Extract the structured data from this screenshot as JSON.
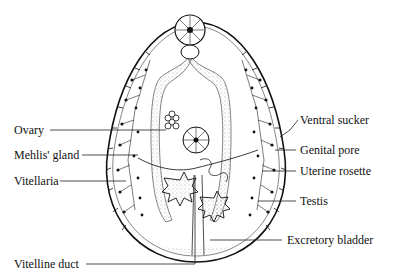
{
  "diagram": {
    "labels_left": [
      {
        "id": "ovary",
        "text": "Ovary"
      },
      {
        "id": "mehlis-gland",
        "text": "Mehlis' gland"
      },
      {
        "id": "vitellaria",
        "text": "Vitellaria"
      },
      {
        "id": "vitelline-duct",
        "text": "Vitelline duct"
      }
    ],
    "labels_right": [
      {
        "id": "ventral-sucker",
        "text": "Ventral sucker"
      },
      {
        "id": "genital-pore",
        "text": "Genital pore"
      },
      {
        "id": "uterine-rosette",
        "text": "Uterine rosette"
      },
      {
        "id": "testis",
        "text": "Testis"
      },
      {
        "id": "excretory-bladder",
        "text": "Excretory bladder"
      }
    ]
  }
}
